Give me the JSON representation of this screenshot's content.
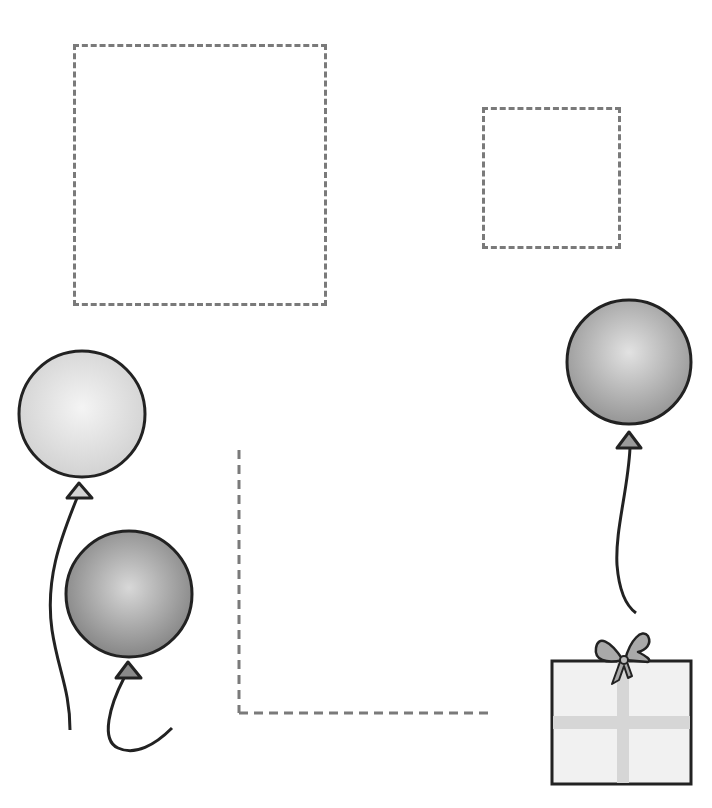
{
  "worksheet": {
    "type": "balloon-and-gift tracing worksheet",
    "colors": {
      "dash": "#7a7a7a",
      "outline": "#222222",
      "balloon_light": "#dcdcdc",
      "balloon_dark": "#8f8f8f",
      "balloon_mid": "#a6a6a6",
      "gift_fill": "#f1f1f1",
      "ribbon": "#d6d6d6",
      "bow": "#a9a9a9"
    },
    "dashed_shapes": [
      {
        "name": "large-dashed-box",
        "x": 73,
        "y": 44,
        "w": 254,
        "h": 262
      },
      {
        "name": "small-dashed-box",
        "x": 482,
        "y": 107,
        "w": 139,
        "h": 142
      },
      {
        "name": "dashed-corner-line",
        "x": 238,
        "y": 450,
        "w": 254,
        "h": 264
      }
    ],
    "balloons": [
      {
        "name": "light-balloon",
        "cx": 82,
        "cy": 414,
        "r": 63,
        "shade": "light"
      },
      {
        "name": "dark-balloon",
        "cx": 129,
        "cy": 594,
        "r": 63,
        "shade": "dark"
      },
      {
        "name": "right-balloon",
        "cx": 629,
        "cy": 362,
        "r": 62,
        "shade": "mid"
      }
    ],
    "gift": {
      "x": 552,
      "y": 661,
      "w": 139,
      "h": 123
    }
  }
}
